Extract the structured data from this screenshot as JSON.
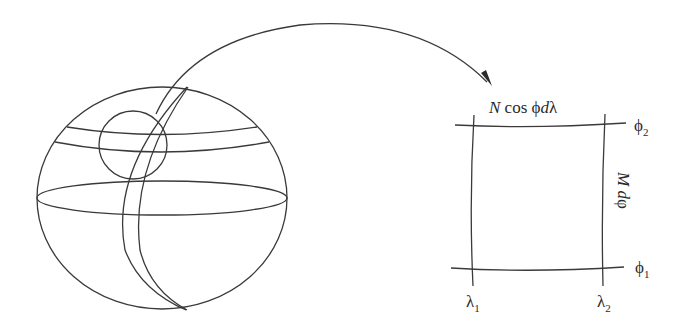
{
  "diagram": {
    "type": "ellipsoid surface element",
    "stroke_color": "#3a3a3a",
    "background": "#ffffff",
    "globe": {
      "description": "ellipsoid with parallels, two meridians and a highlighted circular region",
      "center": [
        162,
        198
      ],
      "rx": 125,
      "ry": 112
    },
    "arrow": {
      "description": "curved arrow from highlighted region to enlarged patch"
    },
    "patch": {
      "top_label_N": "N",
      "top_label_rest": " cos ",
      "top_label_phi": "ϕ",
      "top_label_d": "d",
      "top_label_lambda": "λ",
      "side_label_M": "M",
      "side_label_d": " d",
      "side_label_phi": "φ",
      "phi2_symbol": "ϕ",
      "phi2_sub": "2",
      "phi1_symbol": "ϕ",
      "phi1_sub": "1",
      "lambda1_symbol": "λ",
      "lambda1_sub": "1",
      "lambda2_symbol": "λ",
      "lambda2_sub": "2"
    }
  }
}
